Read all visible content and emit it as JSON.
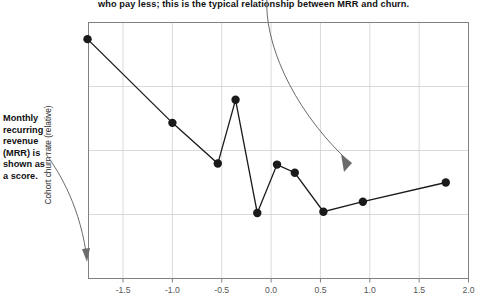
{
  "annotations": {
    "top_caption": "who pay less; this is the typical relationship between MRR and churn.",
    "left_caption_lines": [
      "Monthly",
      "recurring",
      "revenue",
      "(MRR) is",
      "shown as",
      "a score."
    ],
    "left_caption_text": "Monthly recurring revenue (MRR) is shown as a score."
  },
  "chart_data": {
    "type": "line",
    "title": "",
    "xlabel": "",
    "ylabel": "Cohort churn rate (relative)",
    "xlim": [
      -1.85,
      2.0
    ],
    "ylim": [
      0,
      1
    ],
    "grid": true,
    "legend": "none",
    "xticks": [
      -1.5,
      -1.0,
      -0.5,
      0.0,
      0.5,
      1.0,
      1.5,
      2.0
    ],
    "xticklabels": [
      "-1.5",
      "-1.0",
      "-0.5",
      "0.0",
      "0.5",
      "1.0",
      "1.5",
      "2.0"
    ],
    "yticks": [],
    "yticklabels": [],
    "series": [
      {
        "name": "Cohort churn rate (relative)",
        "marker": "filled-circle",
        "color": "#1a1a1a",
        "x": [
          -1.86,
          -1.0,
          -0.54,
          -0.36,
          -0.14,
          0.06,
          0.24,
          0.53,
          0.93,
          1.77
        ],
        "y": [
          0.935,
          0.608,
          0.449,
          0.698,
          0.256,
          0.445,
          0.413,
          0.261,
          0.3,
          0.375
        ]
      }
    ],
    "colors": {
      "line": "#1a1a1a",
      "marker": "#1a1a1a",
      "grid": "#d0d0d0",
      "frame": "#808080",
      "annotation_arrow": "#6b6b6b",
      "text": "#111111",
      "tick_text": "#555555"
    }
  }
}
